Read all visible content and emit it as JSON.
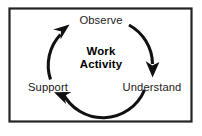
{
  "figure": {
    "frame": {
      "border_color": "#232323",
      "background_color": "#ffffff"
    },
    "center": {
      "line1": "Work",
      "line2": "Activity"
    },
    "nodes": [
      {
        "id": "observe",
        "label": "Observe",
        "position": "top"
      },
      {
        "id": "understand",
        "label": "Understand",
        "position": "bottom-right"
      },
      {
        "id": "support",
        "label": "Support",
        "position": "bottom-left"
      }
    ],
    "arrows": [
      {
        "id": "observe-to-understand",
        "from": "Observe",
        "to": "Understand",
        "direction": "clockwise"
      },
      {
        "id": "understand-to-support",
        "from": "Understand",
        "to": "Support",
        "direction": "clockwise"
      },
      {
        "id": "support-to-observe",
        "from": "Support",
        "to": "Observe",
        "direction": "clockwise"
      }
    ],
    "colors": {
      "stroke": "#111111",
      "text": "#1a1a1a",
      "center_text": "#000000"
    }
  }
}
